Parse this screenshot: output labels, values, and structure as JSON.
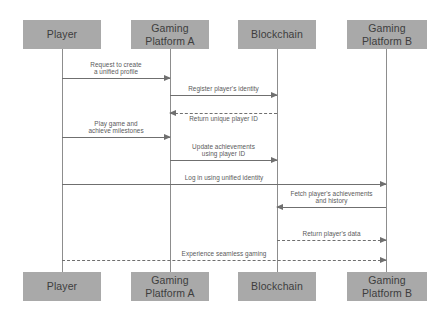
{
  "diagram": {
    "type": "sequence-diagram",
    "title": "",
    "canvas": {
      "width": 447,
      "height": 321
    },
    "colors": {
      "participant_fill": "#a9a9a9",
      "participant_text": "#3d3d3d",
      "line": "#6f6f6f",
      "lifeline": "#8d8d8d",
      "label_text": "#5a5a5a",
      "background": "#ffffff"
    },
    "participants": [
      {
        "id": "player",
        "label": "Player",
        "x": 62,
        "box_left": 23,
        "box_width": 78
      },
      {
        "id": "platform_a",
        "label": "Gaming\nPlatform A",
        "x": 170,
        "box_left": 131,
        "box_width": 78
      },
      {
        "id": "blockchain",
        "label": "Blockchain",
        "x": 277,
        "box_left": 238,
        "box_width": 78
      },
      {
        "id": "platform_b",
        "label": "Gaming\nPlatform B",
        "x": 386,
        "box_left": 347,
        "box_width": 80
      }
    ],
    "header_box": {
      "top": 20,
      "height": 29
    },
    "footer_box": {
      "top": 272,
      "height": 29
    },
    "lifeline_span": {
      "top": 49,
      "bottom": 272
    },
    "messages": [
      {
        "id": "m1",
        "from": "player",
        "to": "platform_a",
        "direction": "right",
        "style": "solid",
        "label": "Request to create\na unified profile",
        "label_position": "above",
        "y": 78
      },
      {
        "id": "m2",
        "from": "platform_a",
        "to": "blockchain",
        "direction": "right",
        "style": "solid",
        "label": "Register player's identity",
        "label_position": "above",
        "y": 95
      },
      {
        "id": "m3",
        "from": "blockchain",
        "to": "platform_a",
        "direction": "left",
        "style": "dashed",
        "label": "Return unique player ID",
        "label_position": "below",
        "y": 113
      },
      {
        "id": "m4",
        "from": "player",
        "to": "platform_a",
        "direction": "right",
        "style": "solid",
        "label": "Play game and\nachieve milestones",
        "label_position": "above",
        "y": 137
      },
      {
        "id": "m5",
        "from": "platform_a",
        "to": "blockchain",
        "direction": "right",
        "style": "solid",
        "label": "Update achievements\nusing player ID",
        "label_position": "above",
        "y": 160
      },
      {
        "id": "m6",
        "from": "player",
        "to": "platform_b",
        "direction": "right",
        "style": "solid",
        "label": "Log in using unified identity",
        "label_position": "above",
        "y": 184
      },
      {
        "id": "m7",
        "from": "platform_b",
        "to": "blockchain",
        "direction": "left",
        "style": "solid",
        "label": "Fetch player's achievements\nand history",
        "label_position": "above",
        "y": 207
      },
      {
        "id": "m8",
        "from": "blockchain",
        "to": "platform_b",
        "direction": "right",
        "style": "dashed",
        "label": "Return player's data",
        "label_position": "above",
        "y": 240
      },
      {
        "id": "m9",
        "from": "player",
        "to": "platform_b",
        "direction": "right",
        "style": "dashed",
        "label": "Experience seamless gaming",
        "label_position": "above",
        "y": 260
      }
    ]
  }
}
